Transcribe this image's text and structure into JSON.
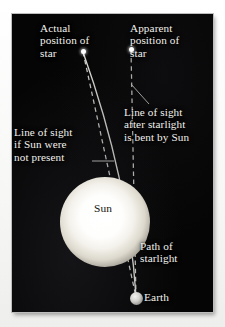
{
  "diagram": {
    "background_color": "#050505",
    "text_color": "#f2f1ec"
  },
  "labels": {
    "actual_star": "Actual\nposition of\nstar",
    "apparent_star": "Apparent\nposition of\nstar",
    "line_of_sight_no_sun": "Line of sight\nif Sun were\nnot present",
    "line_of_sight_bent": "Line of sight\nafter starlight\nis bent by Sun",
    "path_of_starlight": "Path of\nstarlight",
    "sun": "Sun",
    "earth": "Earth"
  },
  "objects": {
    "sun": {
      "name": "Sun",
      "color": "#ffffff",
      "center_x": 93,
      "center_y": 208,
      "radius": 33
    },
    "earth": {
      "name": "Earth",
      "color": "#d2d0cb",
      "center_x": 136,
      "center_y": 297,
      "radius": 6
    },
    "actual_star": {
      "name": "Actual position of star",
      "color": "#ffffff",
      "x": 83,
      "y": 52
    },
    "apparent_star": {
      "name": "Apparent position of star",
      "color": "#ffffff",
      "x": 131,
      "y": 49
    }
  },
  "lines": {
    "true_line_of_sight": {
      "style": "dashed",
      "color": "#e8e6df",
      "from": "actual_star",
      "to": "earth"
    },
    "starlight_path": {
      "style": "solid",
      "color": "#f4f2eb",
      "from": "actual_star",
      "to": "earth",
      "curved": true
    },
    "apparent_line_of_sight": {
      "style": "dashed",
      "color": "#e8e6df",
      "from": "apparent_star",
      "to": "earth"
    }
  }
}
